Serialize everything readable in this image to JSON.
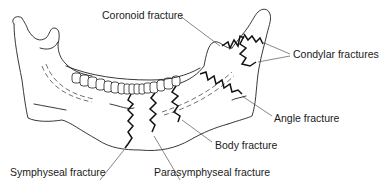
{
  "diagram": {
    "labels": {
      "coronoid": "Coronoid fracture",
      "condylar": "Condylar fractures",
      "angle": "Angle fracture",
      "body": "Body fracture",
      "symphyseal": "Symphyseal fracture",
      "parasymphyseal": "Parasymphyseal fracture"
    }
  }
}
